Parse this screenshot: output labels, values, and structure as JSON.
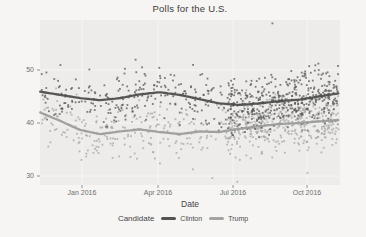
{
  "window": {
    "background": "#f6f5f3",
    "panel_background": "#edecea"
  },
  "chart_data": {
    "type": "scatter",
    "title": "Polls for the U.S.",
    "xlabel": "Date",
    "ylabel": "",
    "x_tick_labels": [
      "Jan 2016",
      "Apr 2016",
      "Jul 2016",
      "Oct 2016"
    ],
    "y_tick_labels": [
      "50",
      "40",
      "30"
    ],
    "y_ticks": [
      50,
      40,
      30
    ],
    "ylim": [
      28,
      59.5
    ],
    "x_span": "mid-Nov 2015 to early-Nov 2016",
    "grid": "faint white major gridlines on light gray panel",
    "legend": {
      "title": "Candidate",
      "position": "bottom",
      "items": [
        {
          "label": "Clinton",
          "color": "#545454"
        },
        {
          "label": "Trump",
          "color": "#a3a3a3"
        }
      ]
    },
    "series": [
      {
        "name": "Clinton",
        "point_color": "#585858",
        "line_color": "#4e4e4e",
        "trend": {
          "x_months": [
            -1.67,
            -0.87,
            -0.08,
            0.72,
            1.51,
            2.3,
            3.1,
            3.89,
            4.69,
            5.48,
            6.28,
            7.07,
            7.87,
            8.66,
            9.45,
            10.25
          ],
          "values": [
            45.9,
            45.3,
            44.7,
            44.3,
            44.7,
            45.4,
            45.8,
            45.3,
            44.5,
            43.7,
            43.4,
            43.7,
            44.1,
            44.4,
            45.0,
            45.6
          ]
        },
        "scatter": {
          "seed": 13,
          "clip": [
            36.5,
            53.5
          ],
          "segments": [
            {
              "count": 230,
              "m_min": -1.67,
              "m_max": 5.8,
              "spread": 4.8
            },
            {
              "count": 430,
              "m_min": 5.8,
              "m_max": 10.25,
              "spread": 5.0
            }
          ]
        }
      },
      {
        "name": "Trump",
        "point_color": "#a6a6a6",
        "line_color": "#9c9c9c",
        "trend": {
          "x_months": [
            -1.67,
            -0.87,
            -0.08,
            0.72,
            1.51,
            2.3,
            3.1,
            3.89,
            4.69,
            5.48,
            6.28,
            7.07,
            7.87,
            8.66,
            9.45,
            10.25
          ],
          "values": [
            42.0,
            40.4,
            38.7,
            37.9,
            38.4,
            38.8,
            38.3,
            37.9,
            38.4,
            38.3,
            38.9,
            39.4,
            39.8,
            40.0,
            40.3,
            40.6
          ]
        },
        "scatter": {
          "seed": 29,
          "clip": [
            28.5,
            48.0
          ],
          "segments": [
            {
              "count": 230,
              "m_min": -1.67,
              "m_max": 5.8,
              "spread": 5.2
            },
            {
              "count": 430,
              "m_min": 5.8,
              "m_max": 10.25,
              "spread": 5.2
            }
          ]
        }
      }
    ],
    "extra_points": [
      {
        "series": "Clinton",
        "x_month": 7.6,
        "value": 58.8
      },
      {
        "series": "Trump",
        "x_month": 5.2,
        "value": 29.6
      },
      {
        "series": "Trump",
        "x_month": 6.2,
        "value": 28.9
      },
      {
        "series": "Trump",
        "x_month": 9.0,
        "value": 30.6
      }
    ]
  }
}
